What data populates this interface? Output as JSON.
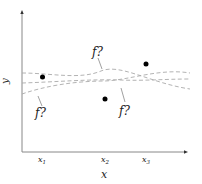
{
  "diagram": {
    "axis_labels": {
      "x": "x",
      "y": "y"
    },
    "x_ticks": [
      {
        "label": "x",
        "sub": "1"
      },
      {
        "label": "x",
        "sub": "2"
      },
      {
        "label": "x",
        "sub": "3"
      }
    ],
    "function_labels": [
      "f?",
      "f?",
      "f?"
    ],
    "points": [
      {
        "name": "observation-1",
        "x_tick": "x1"
      },
      {
        "name": "observation-2",
        "x_tick": "x2"
      },
      {
        "name": "observation-3",
        "x_tick": "x3"
      }
    ],
    "colors": {
      "axis": "#888888",
      "curve": "#aaaaaa",
      "point": "#000000",
      "text": "#222222"
    }
  }
}
